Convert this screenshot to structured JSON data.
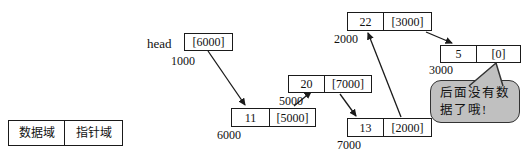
{
  "diagram": {
    "title_hint": "singly linked list with head pointer",
    "legend": {
      "data_field": "数据域",
      "pointer_field": "指针域"
    },
    "head": {
      "label": "head",
      "value": "[6000]",
      "address": "1000"
    },
    "nodes": [
      {
        "data": "11",
        "pointer": "[5000]",
        "address": "6000"
      },
      {
        "data": "20",
        "pointer": "[7000]",
        "address": "5000"
      },
      {
        "data": "13",
        "pointer": "[2000]",
        "address": "7000"
      },
      {
        "data": "22",
        "pointer": "[3000]",
        "address": "2000"
      },
      {
        "data": "5",
        "pointer": "[0]",
        "address": "3000"
      }
    ],
    "connections": [
      {
        "from": "head(1000)",
        "to": "6000"
      },
      {
        "from": "6000",
        "to": "5000"
      },
      {
        "from": "5000",
        "to": "7000"
      },
      {
        "from": "7000",
        "to": "2000"
      },
      {
        "from": "2000",
        "to": "3000"
      }
    ],
    "callout": {
      "line1": "后面没有数",
      "line2": "据了哦!",
      "points_to": "[0]",
      "fill_color": "#c0c0c0"
    },
    "colors": {
      "line": "#1a1a1a",
      "background": "#ffffff"
    }
  }
}
